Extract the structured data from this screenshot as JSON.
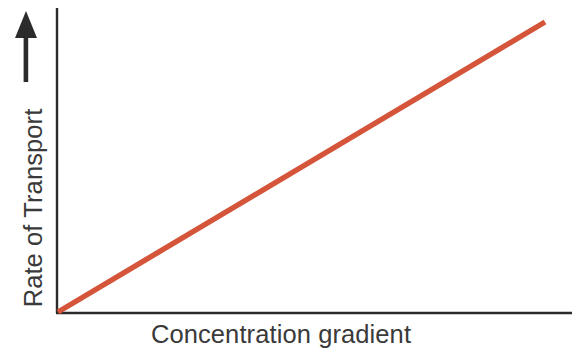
{
  "figure": {
    "background_color": "#ffffff",
    "axis_color": "#2b2b2b",
    "label_color": "#3a3a3a"
  },
  "axes": {
    "y_axis_label": "Rate of Transport",
    "y_axis_arrow_icon": "up-arrow-icon",
    "x_axis_label": "Concentration gradient"
  },
  "chart_data": {
    "type": "line",
    "title": "",
    "subtitle": "",
    "xlabel": "Concentration gradient",
    "ylabel": "Rate of Transport",
    "xlim": [
      0,
      100
    ],
    "ylim": [
      0,
      100
    ],
    "grid": false,
    "legend": "none",
    "xticks": [],
    "yticks": [],
    "xticklabels": [],
    "yticklabels": [],
    "annotations": [],
    "series": [
      {
        "name": "Rate of transport",
        "color": "#d4553a",
        "linewidth": 5.4,
        "x": [
          0,
          100
        ],
        "y": [
          0,
          100
        ],
        "description": "Straight line of constant positive slope passing through the origin; rate increases in direct proportion to the concentration gradient with no saturation"
      }
    ]
  }
}
